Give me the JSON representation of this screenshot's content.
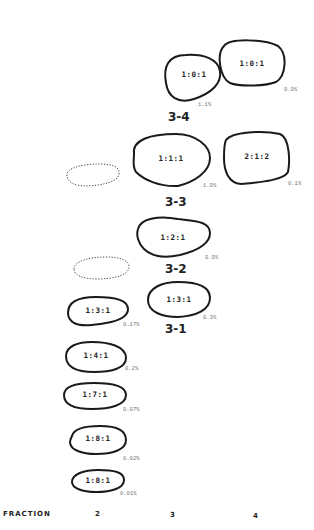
{
  "figure": {
    "spots": [
      {
        "ratio": "1:0:1",
        "percent": "0.9%",
        "fraction": 4
      },
      {
        "ratio": "1:0:1",
        "percent": "1.1%",
        "fraction": 3
      },
      {
        "ratio": "1:1:1",
        "percent": "1.9%",
        "fraction": 3
      },
      {
        "ratio": "2:1:2",
        "percent": "0.1%",
        "fraction": 4
      },
      {
        "ratio": "1:2:1",
        "percent": "0.9%",
        "fraction": 3
      },
      {
        "ratio": "1:3:1",
        "percent": "0.3%",
        "fraction": 3
      },
      {
        "ratio": "1:3:1",
        "percent": "0.17%",
        "fraction": 2
      },
      {
        "ratio": "1:4:1",
        "percent": "0.2%",
        "fraction": 2
      },
      {
        "ratio": "1:7:1",
        "percent": "0.07%",
        "fraction": 2
      },
      {
        "ratio": "1:8:1",
        "percent": "0.02%",
        "fraction": 2
      },
      {
        "ratio": "1:8:1",
        "percent": "0.01%",
        "fraction": 2
      }
    ],
    "groups": [
      "3-4",
      "3-3",
      "3-2",
      "3-1"
    ],
    "axis": {
      "label": "FRACTION",
      "ticks": [
        "2",
        "3",
        "4"
      ]
    }
  }
}
